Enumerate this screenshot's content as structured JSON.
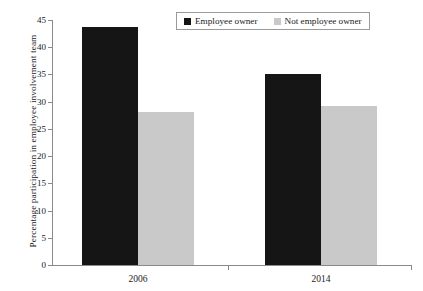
{
  "chart_data": {
    "type": "bar",
    "title": "",
    "subtitle": "",
    "xlabel": "",
    "ylabel": "Percentage participation in employee involvement team",
    "categories": [
      "2006",
      "2014"
    ],
    "series": [
      {
        "name": "Employee owner",
        "color": "#151515",
        "values": [
          43.8,
          35.1
        ]
      },
      {
        "name": "Not employee owner",
        "color": "#c9c9c9",
        "values": [
          28.1,
          29.2
        ]
      }
    ],
    "ylim": [
      0,
      45
    ],
    "ytick_step": 5,
    "yticks": [
      0,
      5,
      10,
      15,
      20,
      25,
      30,
      35,
      40,
      45
    ],
    "ytick_labels": [
      "0",
      "5",
      "10",
      "15",
      "20",
      "25",
      "30",
      "35",
      "40",
      "45"
    ],
    "grid": false,
    "legend_position": "top-right",
    "legend_entries": [
      "Employee owner",
      "Not employee owner"
    ]
  }
}
